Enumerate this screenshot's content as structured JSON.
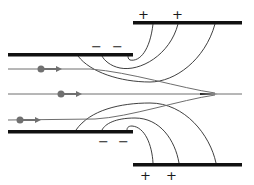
{
  "diagram": {
    "upper_inner_plate": {
      "charges": [
        "−",
        "−"
      ]
    },
    "upper_outer_plate": {
      "charges": [
        "+",
        "+"
      ]
    },
    "lower_inner_plate": {
      "charges": [
        "−",
        "−"
      ]
    },
    "lower_outer_plate": {
      "charges": [
        "+",
        "+"
      ]
    },
    "particles": [
      {
        "name": "upper-particle",
        "color": "#707070"
      },
      {
        "name": "middle-particle",
        "color": "#707070"
      },
      {
        "name": "lower-particle",
        "color": "#707070"
      }
    ],
    "colors": {
      "plate": "#111111",
      "field_line": "#2a2a2a",
      "beam": "#6e6e6e",
      "particle": "#707070"
    }
  }
}
